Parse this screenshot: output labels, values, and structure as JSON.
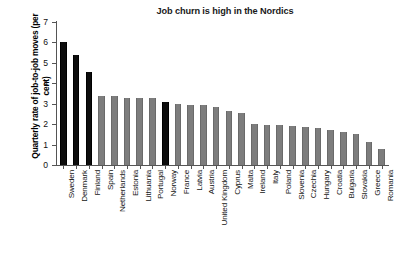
{
  "chart_data": {
    "type": "bar",
    "title": "Job churn is high in the Nordics",
    "xlabel": "",
    "ylabel": "Quarterly rate of job-to-job moves (per cent)",
    "ylim": [
      0,
      7
    ],
    "yticks": [
      0,
      1,
      2,
      3,
      4,
      5,
      6,
      7
    ],
    "grid": false,
    "legend": "none",
    "highlight_color": "#0d0d0d",
    "bar_color": "#7d7d7d",
    "highlighted_categories": [
      "Sweden",
      "Denmark",
      "Finland",
      "Norway"
    ],
    "categories": [
      "Sweden",
      "Denmark",
      "Finland",
      "Spain",
      "Netherlands",
      "Estonia",
      "Lithuania",
      "Portugal",
      "Norway",
      "France",
      "Latvia",
      "Austria",
      "United Kingdom",
      "Cyprus",
      "Malta",
      "Ireland",
      "Italy",
      "Poland",
      "Slovenia",
      "Czechia",
      "Hungary",
      "Croatia",
      "Bulgaria",
      "Slovakia",
      "Greece",
      "Romania"
    ],
    "values": [
      6.0,
      5.4,
      4.55,
      3.38,
      3.38,
      3.27,
      3.27,
      3.27,
      3.08,
      2.97,
      2.95,
      2.95,
      2.85,
      2.65,
      2.55,
      2.0,
      1.95,
      1.95,
      1.9,
      1.85,
      1.8,
      1.7,
      1.6,
      1.5,
      1.15,
      0.8
    ]
  }
}
